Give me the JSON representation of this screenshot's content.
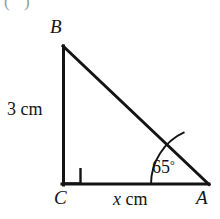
{
  "figure": {
    "type": "right-triangle-trigonometry-diagram",
    "background_color": "#ffffff",
    "stroke_color": "#141414",
    "partial_item_label": "( )",
    "vertices": {
      "B": {
        "label": "B",
        "x": 63,
        "y": 46
      },
      "C": {
        "label": "C",
        "x": 63,
        "y": 184
      },
      "A": {
        "label": "A",
        "x": 208,
        "y": 184
      }
    },
    "sides": [
      {
        "name": "BC",
        "label": "3 cm",
        "value": "3",
        "unit": "cm",
        "italic_part": ""
      },
      {
        "name": "CA",
        "label": "x cm",
        "value": "x",
        "unit": "cm",
        "italic_part": "x"
      },
      {
        "name": "AB",
        "label": "",
        "value": "",
        "unit": ""
      }
    ],
    "angles": [
      {
        "at": "C",
        "label": "",
        "marker": "right-angle-square",
        "value": "90"
      },
      {
        "at": "A",
        "label": "65°",
        "marker": "arc",
        "value": "65",
        "unit": "degrees"
      }
    ],
    "labels": {
      "vertex_b": "B",
      "vertex_c": "C",
      "vertex_a": "A",
      "side_vertical": "3 cm",
      "side_base_value": "x",
      "side_base_unit": "cm",
      "angle_value": "65",
      "angle_degree_symbol": "°"
    }
  }
}
